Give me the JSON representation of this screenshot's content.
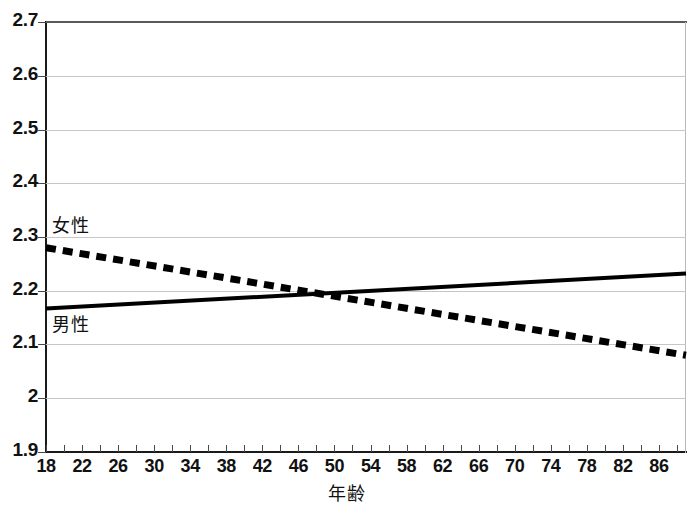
{
  "chart_data": {
    "type": "line",
    "title": "",
    "xlabel": "年齢",
    "ylabel": "",
    "xlim": [
      18,
      89
    ],
    "ylim": [
      1.9,
      2.7
    ],
    "grid": true,
    "legend_position": "inline-labels",
    "x_tick_labels": [
      "18",
      "22",
      "26",
      "30",
      "34",
      "38",
      "42",
      "46",
      "50",
      "54",
      "58",
      "62",
      "66",
      "70",
      "74",
      "78",
      "82",
      "86"
    ],
    "x_tick_values": [
      18,
      22,
      26,
      30,
      34,
      38,
      42,
      46,
      50,
      54,
      58,
      62,
      66,
      70,
      74,
      78,
      82,
      86
    ],
    "x_minor_tick_step": 2,
    "y_tick_labels": [
      "2.7",
      "2.6",
      "2.5",
      "2.4",
      "2.3",
      "2.2",
      "2.1",
      "2",
      "1.9"
    ],
    "y_tick_values": [
      2.7,
      2.6,
      2.5,
      2.4,
      2.3,
      2.2,
      2.1,
      2.0,
      1.9
    ],
    "series": [
      {
        "name": "女性",
        "style": "dashed",
        "color": "#000000",
        "x": [
          18,
          89
        ],
        "values": [
          2.28,
          2.08
        ],
        "label_position": {
          "x": 20,
          "y": 2.33
        }
      },
      {
        "name": "男性",
        "style": "solid",
        "color": "#000000",
        "x": [
          18,
          89
        ],
        "values": [
          2.167,
          2.232
        ],
        "label_position": {
          "x": 20,
          "y": 2.145
        }
      }
    ],
    "crossing_point": {
      "x": 47,
      "y": 2.2
    }
  },
  "labels": {
    "female": "女性",
    "male": "男性",
    "x_axis_title": "年齢"
  }
}
